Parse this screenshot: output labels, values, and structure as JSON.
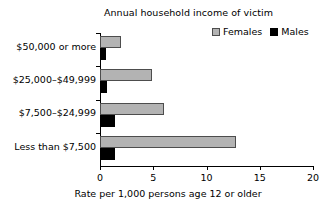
{
  "chart_data": {
    "type": "bar",
    "orientation": "horizontal",
    "title": "Annual household income of victim",
    "xlabel": "Rate per 1,000 persons age 12 or older",
    "ylabel": "",
    "categories": [
      "$50,000 or more",
      "$25,000–$49,999",
      "$7,500–$24,999",
      "Less than $7,500"
    ],
    "series": [
      {
        "name": "Females",
        "color": "#b3b3b3",
        "values": [
          2.0,
          4.9,
          6.0,
          12.8
        ]
      },
      {
        "name": "Males",
        "color": "#000000",
        "values": [
          0.6,
          0.7,
          1.4,
          1.4
        ]
      }
    ],
    "xlim": [
      0,
      20
    ],
    "xticks": [
      0,
      5,
      10,
      15,
      20
    ],
    "xtick_labels": [
      "0",
      "5",
      "10",
      "15",
      "20"
    ],
    "grid": false,
    "legend_position": "top-right"
  },
  "legend": {
    "items": [
      {
        "label": "Females",
        "swatch": "gray-square-swatch"
      },
      {
        "label": "Males",
        "swatch": "black-square-swatch"
      }
    ]
  }
}
